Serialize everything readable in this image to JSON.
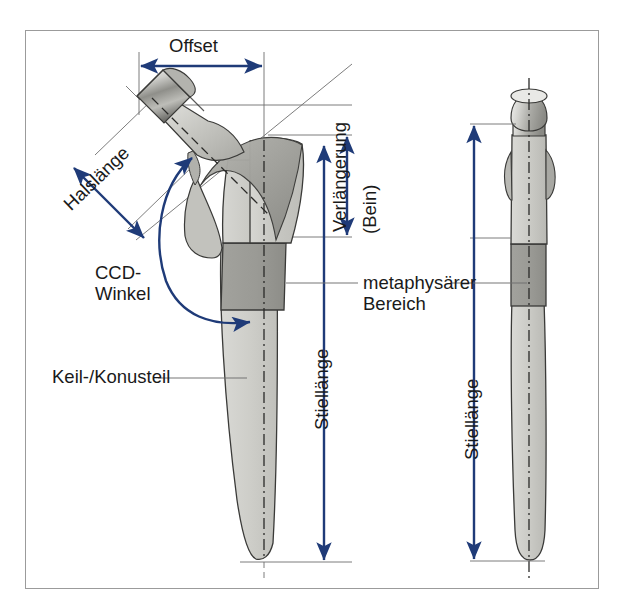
{
  "figure": {
    "frame_border_color": "#9b9b9b",
    "background": "#ffffff"
  },
  "colors": {
    "dimension_blue": "#1f3b78",
    "thin_line_gray": "#6e6e6e",
    "implant_light": "#cfcfcb",
    "implant_mid": "#b5b5b0",
    "implant_dark": "#8f8f8a",
    "implant_outline": "#3a3a38",
    "metaphyseal_band": "#9a9a95",
    "text": "#1a1a1a"
  },
  "labels": {
    "offset": "Offset",
    "halslaenge": "Halslänge",
    "ccd_line1": "CCD-",
    "ccd_line2": "Winkel",
    "keil_konusteil": "Keil-/Konusteil",
    "verlaengerung": "Verlängerung",
    "bein": "(Bein)",
    "metaphysaer_line1": "metaphysärer",
    "metaphysaer_line2": "Bereich",
    "stiellaenge_left": "Stiellänge",
    "stiellaenge_right": "Stiellänge"
  },
  "views": {
    "left": {
      "name": "frontal-view",
      "description": "Frontalansicht des Hueftschafts mit Konus, Hals, metaphysaerem Bereich und Keil-/Konusteil"
    },
    "right": {
      "name": "lateral-view",
      "description": "Seitenansicht des Hueftschafts mit metaphysaerem Bereich"
    }
  },
  "dimensions": [
    {
      "id": "offset",
      "label": "Offset",
      "orientation": "horizontal",
      "arrow": "double",
      "view": "left"
    },
    {
      "id": "halslaenge",
      "label": "Halslänge",
      "orientation": "diagonal",
      "arrow": "double",
      "view": "left"
    },
    {
      "id": "ccd-winkel",
      "label": "CCD-Winkel",
      "orientation": "arc",
      "arrow": "double",
      "view": "left"
    },
    {
      "id": "verlaengerung",
      "label": "Verlängerung (Bein)",
      "orientation": "vertical",
      "arrow": "double",
      "view": "left"
    },
    {
      "id": "stiellaenge-l",
      "label": "Stiellänge",
      "orientation": "vertical",
      "arrow": "double",
      "view": "left"
    },
    {
      "id": "stiellaenge-r",
      "label": "Stiellänge",
      "orientation": "vertical",
      "arrow": "double",
      "view": "right"
    }
  ],
  "callouts": [
    {
      "id": "keil-konusteil",
      "label": "Keil-/Konusteil",
      "points_to": "left-stem-distal"
    },
    {
      "id": "metaphysaer-left",
      "label": "metaphysärer Bereich",
      "points_to": "left-stem-band"
    },
    {
      "id": "metaphysaer-right",
      "label": "metaphysärer Bereich",
      "points_to": "right-stem-band"
    }
  ]
}
